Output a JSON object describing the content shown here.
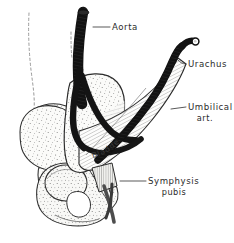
{
  "figure": {
    "background_color": "#ffffff",
    "ink_color": "#1a1a1a",
    "stipple_color": "#6b6b6b",
    "vessel_color": "#111111",
    "label_color": "#2b2b2b"
  },
  "labels": {
    "aorta": "Aorta",
    "urachus": "Urachus",
    "umbilical_line1": "Umbilical",
    "umbilical_line2": "art.",
    "bladder": "Bladder",
    "symphysis_line1": "Symphysis",
    "symphysis_line2": "pubis"
  },
  "structures": [
    {
      "name": "aorta",
      "type": "vessel",
      "fill": "#111111"
    },
    {
      "name": "common-iliac-artery-left",
      "type": "vessel",
      "fill": "#141414"
    },
    {
      "name": "common-iliac-artery-right",
      "type": "vessel",
      "fill": "#141414"
    },
    {
      "name": "umbilical-artery",
      "type": "vessel",
      "fill": "#111111"
    },
    {
      "name": "urachus",
      "type": "cord",
      "fill": "#141414"
    },
    {
      "name": "umbilicus-tip",
      "type": "marker",
      "fill": "#ffffff"
    },
    {
      "name": "bladder",
      "type": "organ",
      "fill": "#f2f2f0"
    },
    {
      "name": "median-umbilical-fold",
      "type": "membrane",
      "fill": "#fbfbfa"
    },
    {
      "name": "ilium",
      "type": "bone",
      "fill": "#f4f4f2"
    },
    {
      "name": "ischium",
      "type": "bone",
      "fill": "#f4f4f2"
    },
    {
      "name": "femoral-head",
      "type": "bone",
      "fill": "#ededea"
    },
    {
      "name": "obturator-foramen",
      "type": "aperture",
      "fill": "#ffffff"
    },
    {
      "name": "symphysis-pubis",
      "type": "cartilage",
      "fill": "#e9e9e6"
    },
    {
      "name": "body-outline",
      "type": "dashed-contour",
      "fill": "none"
    }
  ]
}
